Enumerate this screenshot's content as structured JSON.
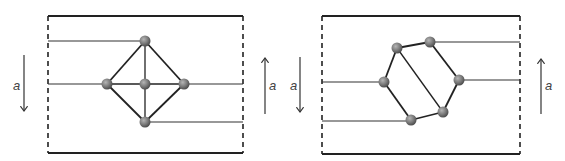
{
  "figure": {
    "panels": [
      {
        "name": "left-panel",
        "arrow_left": {
          "direction": "down",
          "label": "a"
        },
        "arrow_right": {
          "direction": "up",
          "label": "a"
        },
        "nodes": [
          "top",
          "left",
          "center",
          "right",
          "bottom"
        ],
        "edges": [
          [
            "top",
            "left"
          ],
          [
            "top",
            "right"
          ],
          [
            "top",
            "center"
          ],
          [
            "left",
            "center"
          ],
          [
            "center",
            "right"
          ],
          [
            "center",
            "bottom"
          ],
          [
            "left",
            "bottom"
          ],
          [
            "right",
            "bottom"
          ]
        ],
        "leads": [
          {
            "from_edge": "left",
            "to_node": "top"
          },
          {
            "from_edge": "left",
            "to_node": "left"
          },
          {
            "from_edge": "right",
            "to_node": "right"
          },
          {
            "from_edge": "right",
            "to_node": "bottom"
          }
        ]
      },
      {
        "name": "right-panel",
        "arrow_left": {
          "direction": "down",
          "label": "a"
        },
        "arrow_right": {
          "direction": "up",
          "label": "a"
        },
        "nodes": [
          "n1",
          "n2",
          "n3",
          "n4",
          "n5",
          "n6"
        ],
        "edges": [
          [
            "n1",
            "n2"
          ],
          [
            "n2",
            "n4"
          ],
          [
            "n4",
            "n5"
          ],
          [
            "n5",
            "n6"
          ],
          [
            "n6",
            "n3"
          ],
          [
            "n3",
            "n1"
          ],
          [
            "n1",
            "n5"
          ]
        ],
        "leads": [
          {
            "from_edge": "right",
            "to_node": "n2"
          },
          {
            "from_edge": "right",
            "to_node": "n4"
          },
          {
            "from_edge": "left",
            "to_node": "n3"
          },
          {
            "from_edge": "left",
            "to_node": "n6"
          }
        ]
      }
    ],
    "colors": {
      "line": "#333333",
      "node_light": "#a8a8a8",
      "node_dark": "#4a4a4a"
    }
  }
}
